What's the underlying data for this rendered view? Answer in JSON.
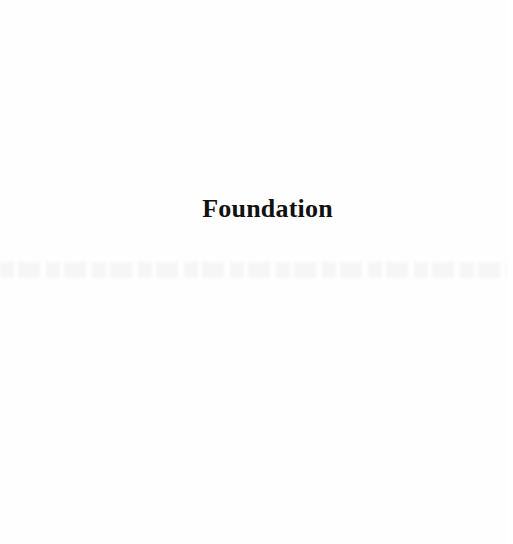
{
  "page": {
    "heading": "Foundation",
    "background_color": "#fefefe",
    "text_color": "#111111",
    "has_bleed_through_text": true
  }
}
